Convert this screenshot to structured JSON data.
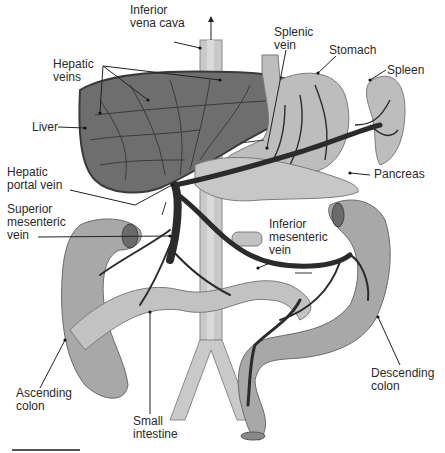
{
  "figure": {
    "type": "anatomical-diagram",
    "labels": [
      {
        "id": "inferior-vena-cava",
        "text": "Inferior\nvena cava",
        "x": 130,
        "y": 4
      },
      {
        "id": "splenic-vein",
        "text": "Splenic\nvein",
        "x": 274,
        "y": 26
      },
      {
        "id": "stomach",
        "text": "Stomach",
        "x": 329,
        "y": 44
      },
      {
        "id": "spleen",
        "text": "Spleen",
        "x": 387,
        "y": 64
      },
      {
        "id": "hepatic-veins",
        "text": "Hepatic\nveins",
        "x": 53,
        "y": 58
      },
      {
        "id": "liver",
        "text": "Liver",
        "x": 32,
        "y": 121
      },
      {
        "id": "hepatic-portal-vein",
        "text": "Hepatic\nportal vein",
        "x": 7,
        "y": 166
      },
      {
        "id": "superior-mesenteric-vein",
        "text": "Superior\nmesenteric\nvein",
        "x": 7,
        "y": 203
      },
      {
        "id": "pancreas",
        "text": "Pancreas",
        "x": 374,
        "y": 168
      },
      {
        "id": "inferior-mesenteric-vein",
        "text": "Inferior\nmesenteric\nvein",
        "x": 269,
        "y": 218
      },
      {
        "id": "ascending-colon",
        "text": "Ascending\ncolon",
        "x": 16,
        "y": 387
      },
      {
        "id": "descending-colon",
        "text": "Descending\ncolon",
        "x": 371,
        "y": 367
      },
      {
        "id": "small-intestine",
        "text": "Small\nintestine",
        "x": 133,
        "y": 415
      }
    ],
    "colors": {
      "liver": "#6e6e6e",
      "liver_outline": "#3a3a3a",
      "organ_light": "#bdbdbd",
      "organ_mid": "#a8a8a8",
      "vein": "#2b2b2b",
      "vena_cava": "#c9c9c9",
      "text": "#2a2a2a",
      "background": "#ffffff"
    }
  }
}
